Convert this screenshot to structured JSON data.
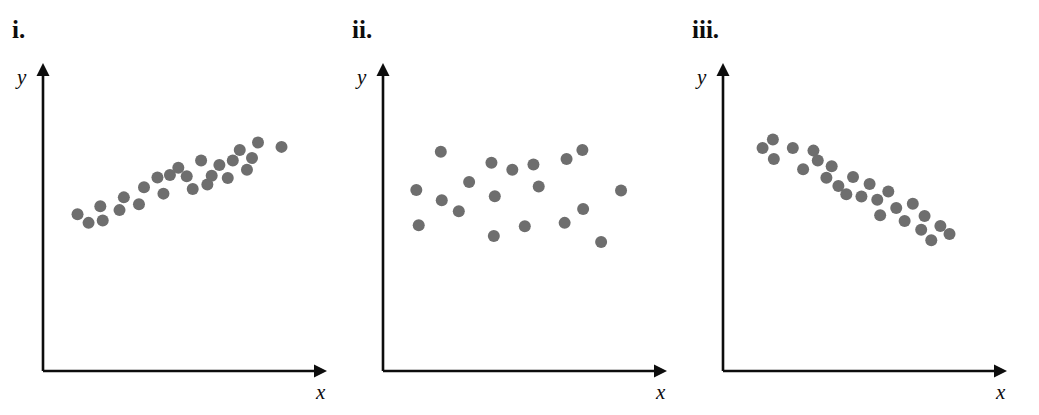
{
  "figure": {
    "background_color": "#ffffff",
    "point_color": "#6e6e6e",
    "axis_color": "#0d0d0d",
    "point_radius": 6
  },
  "panels": [
    {
      "id": "panel-i",
      "label": "i.",
      "x_axis_label": "x",
      "y_axis_label": "y",
      "chart_data": {
        "type": "scatter",
        "title": "i.",
        "xlabel": "x",
        "ylabel": "y",
        "relationship": "positive linear correlation",
        "grid": false,
        "legend": false,
        "axis_arrows": true,
        "tick_labels": [],
        "xlim": [
          0,
          100
        ],
        "ylim": [
          0,
          100
        ],
        "points": [
          {
            "x": 7.3,
            "y": 34.0
          },
          {
            "x": 11.9,
            "y": 28.9
          },
          {
            "x": 16.8,
            "y": 38.7
          },
          {
            "x": 17.8,
            "y": 30.3
          },
          {
            "x": 24.8,
            "y": 36.4
          },
          {
            "x": 26.6,
            "y": 43.9
          },
          {
            "x": 32.9,
            "y": 39.8
          },
          {
            "x": 35.0,
            "y": 49.8
          },
          {
            "x": 40.6,
            "y": 55.6
          },
          {
            "x": 43.1,
            "y": 46.1
          },
          {
            "x": 45.8,
            "y": 57.0
          },
          {
            "x": 49.3,
            "y": 61.3
          },
          {
            "x": 52.8,
            "y": 56.3
          },
          {
            "x": 55.3,
            "y": 48.8
          },
          {
            "x": 58.8,
            "y": 65.6
          },
          {
            "x": 61.4,
            "y": 51.5
          },
          {
            "x": 63.2,
            "y": 56.6
          },
          {
            "x": 66.4,
            "y": 62.9
          },
          {
            "x": 69.9,
            "y": 55.3
          },
          {
            "x": 72.0,
            "y": 65.6
          },
          {
            "x": 74.9,
            "y": 71.8
          },
          {
            "x": 77.9,
            "y": 60.2
          },
          {
            "x": 80.0,
            "y": 67.0
          },
          {
            "x": 82.5,
            "y": 76.2
          },
          {
            "x": 92.3,
            "y": 73.6
          }
        ]
      }
    },
    {
      "id": "panel-ii",
      "label": "ii.",
      "x_axis_label": "x",
      "y_axis_label": "y",
      "chart_data": {
        "type": "scatter",
        "title": "ii.",
        "xlabel": "x",
        "ylabel": "y",
        "relationship": "no correlation",
        "grid": false,
        "legend": false,
        "axis_arrows": true,
        "tick_labels": [],
        "xlim": [
          0,
          100
        ],
        "ylim": [
          0,
          100
        ],
        "points": [
          {
            "x": 6.8,
            "y": 48.3
          },
          {
            "x": 7.8,
            "y": 27.5
          },
          {
            "x": 17.0,
            "y": 70.8
          },
          {
            "x": 17.4,
            "y": 42.2
          },
          {
            "x": 24.5,
            "y": 35.7
          },
          {
            "x": 28.8,
            "y": 53.0
          },
          {
            "x": 38.1,
            "y": 64.3
          },
          {
            "x": 39.5,
            "y": 44.5
          },
          {
            "x": 39.1,
            "y": 21.2
          },
          {
            "x": 46.8,
            "y": 60.1
          },
          {
            "x": 52.0,
            "y": 26.9
          },
          {
            "x": 55.6,
            "y": 63.2
          },
          {
            "x": 57.8,
            "y": 50.3
          },
          {
            "x": 68.6,
            "y": 28.9
          },
          {
            "x": 69.4,
            "y": 66.5
          },
          {
            "x": 76.0,
            "y": 71.8
          },
          {
            "x": 76.3,
            "y": 37.0
          },
          {
            "x": 83.8,
            "y": 17.6
          },
          {
            "x": 92.1,
            "y": 48.0
          }
        ]
      }
    },
    {
      "id": "panel-iii",
      "label": "iii.",
      "x_axis_label": "x",
      "y_axis_label": "y",
      "chart_data": {
        "type": "scatter",
        "title": "iii.",
        "xlabel": "x",
        "ylabel": "y",
        "relationship": "negative linear correlation",
        "grid": false,
        "legend": false,
        "axis_arrows": true,
        "tick_labels": [],
        "xlim": [
          0,
          100
        ],
        "ylim": [
          0,
          100
        ],
        "points": [
          {
            "x": 9.4,
            "y": 73.0
          },
          {
            "x": 13.7,
            "y": 77.9
          },
          {
            "x": 14.1,
            "y": 66.5
          },
          {
            "x": 22.0,
            "y": 73.0
          },
          {
            "x": 26.3,
            "y": 60.5
          },
          {
            "x": 30.6,
            "y": 71.4
          },
          {
            "x": 32.4,
            "y": 65.6
          },
          {
            "x": 36.0,
            "y": 55.4
          },
          {
            "x": 38.2,
            "y": 62.2
          },
          {
            "x": 41.0,
            "y": 50.6
          },
          {
            "x": 44.3,
            "y": 45.7
          },
          {
            "x": 47.1,
            "y": 55.9
          },
          {
            "x": 50.6,
            "y": 44.4
          },
          {
            "x": 54.0,
            "y": 51.8
          },
          {
            "x": 57.2,
            "y": 42.5
          },
          {
            "x": 58.4,
            "y": 33.4
          },
          {
            "x": 61.8,
            "y": 47.3
          },
          {
            "x": 65.1,
            "y": 37.6
          },
          {
            "x": 68.6,
            "y": 30.0
          },
          {
            "x": 72.0,
            "y": 40.1
          },
          {
            "x": 75.5,
            "y": 24.8
          },
          {
            "x": 76.9,
            "y": 33.0
          },
          {
            "x": 79.7,
            "y": 18.7
          },
          {
            "x": 83.5,
            "y": 27.1
          },
          {
            "x": 87.3,
            "y": 22.3
          }
        ]
      }
    }
  ]
}
